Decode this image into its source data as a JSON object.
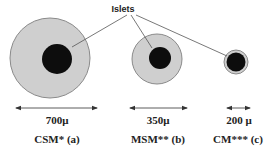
{
  "diagram": {
    "callout_label": "Islets",
    "colors": {
      "capsule_fill": "#cfcfcf",
      "capsule_stroke": "#8a8a8a",
      "islet_fill": "#0d0d0d",
      "line": "#555555"
    },
    "capsules": [
      {
        "id": "a",
        "name": "CSM* (a)",
        "size_label": "700μ",
        "cx": 50,
        "cy": 58,
        "r": 40,
        "islet_cx": 57,
        "islet_cy": 59,
        "islet_r": 15,
        "arrow_x1": 16,
        "arrow_x2": 97
      },
      {
        "id": "b",
        "name": "MSM** (b)",
        "size_label": "350μ",
        "cx": 157,
        "cy": 59,
        "r": 25,
        "islet_cx": 160,
        "islet_cy": 58,
        "islet_r": 11,
        "arrow_x1": 130,
        "arrow_x2": 187
      },
      {
        "id": "c",
        "name": "CM*** (c)",
        "size_label": "200 μ",
        "cx": 236,
        "cy": 62,
        "r": 12,
        "islet_cx": 236,
        "islet_cy": 62,
        "islet_r": 9.5,
        "arrow_x1": 227,
        "arrow_x2": 250
      }
    ]
  }
}
